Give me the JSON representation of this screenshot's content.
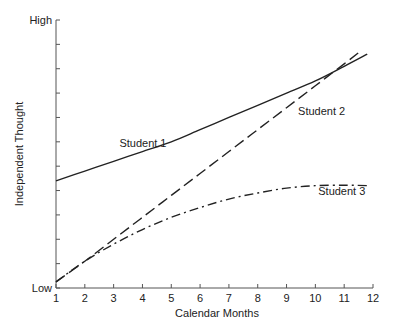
{
  "chart_data": {
    "type": "line",
    "title": "",
    "xlabel": "Calendar Months",
    "ylabel": "Independent Thought",
    "y_tick_labels": {
      "top": "High",
      "bottom": "Low"
    },
    "x_ticks": [
      1,
      2,
      3,
      4,
      5,
      6,
      7,
      8,
      9,
      10,
      11,
      12
    ],
    "xlim": [
      1,
      12
    ],
    "ylim": [
      0,
      11
    ],
    "y_minor_ticks": 11,
    "grid": false,
    "legend": "inline labels",
    "series": [
      {
        "name": "Student 1",
        "style": "solid",
        "x": [
          1,
          2,
          3,
          4,
          5,
          6,
          7,
          8,
          9,
          10,
          11,
          11.8
        ],
        "values": [
          4.4,
          4.8,
          5.2,
          5.6,
          6.0,
          6.5,
          7.0,
          7.5,
          8.0,
          8.5,
          9.1,
          9.6
        ]
      },
      {
        "name": "Student 2",
        "style": "dashed",
        "x": [
          1,
          2,
          3,
          4,
          5,
          6,
          7,
          8,
          9,
          10,
          11,
          11.6
        ],
        "values": [
          0.25,
          1.1,
          2.0,
          2.9,
          3.8,
          4.7,
          5.6,
          6.5,
          7.4,
          8.3,
          9.2,
          9.75
        ]
      },
      {
        "name": "Student 3",
        "style": "dash-dot",
        "x": [
          1,
          2,
          3,
          4,
          5,
          6,
          7,
          8,
          9,
          10,
          11,
          11.8
        ],
        "values": [
          0.25,
          1.1,
          1.8,
          2.4,
          2.9,
          3.3,
          3.65,
          3.9,
          4.1,
          4.2,
          4.22,
          4.2
        ]
      }
    ],
    "annotations": [
      {
        "text": "Student 1",
        "x": 3.2,
        "y": 5.8
      },
      {
        "text": "Student 2",
        "x": 9.4,
        "y": 7.1
      },
      {
        "text": "Student 3",
        "x": 10.1,
        "y": 3.8
      }
    ]
  }
}
